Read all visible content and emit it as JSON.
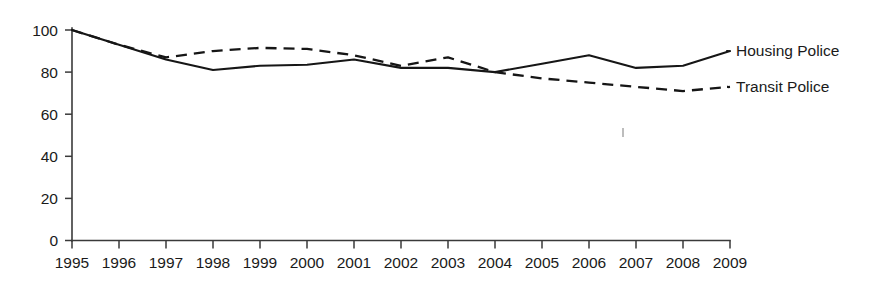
{
  "chart_data": {
    "type": "line",
    "title": "",
    "subtitle": "",
    "xlabel": "",
    "ylabel": "",
    "categories": [
      "1995",
      "1996",
      "1997",
      "1998",
      "1999",
      "2000",
      "2001",
      "2002",
      "2003",
      "2004",
      "2005",
      "2006",
      "2007",
      "2008",
      "2009"
    ],
    "x": [
      1995,
      1996,
      1997,
      1998,
      1999,
      2000,
      2001,
      2002,
      2003,
      2004,
      2005,
      2006,
      2007,
      2008,
      2009
    ],
    "xlim": [
      1995,
      2009
    ],
    "ylim": [
      0,
      100
    ],
    "yticks": [
      0,
      20,
      40,
      60,
      80,
      100
    ],
    "ytick_labels": [
      "0",
      "20",
      "40",
      "60",
      "80",
      "100"
    ],
    "grid": false,
    "legend_position": "right",
    "series": [
      {
        "name": "Housing Police",
        "style": "solid",
        "color": "#161616",
        "values": [
          100,
          93,
          86,
          81,
          83,
          83.5,
          86,
          82,
          82,
          80,
          84,
          88,
          82,
          83,
          90
        ]
      },
      {
        "name": "Transit Police",
        "style": "dashed",
        "color": "#161616",
        "values": [
          100,
          93,
          87,
          90,
          91.5,
          91,
          88,
          83,
          87,
          80,
          77,
          75,
          73,
          71,
          73
        ]
      }
    ]
  },
  "legend": {
    "items": [
      {
        "label": "Housing Police",
        "style": "solid"
      },
      {
        "label": "Transit Police",
        "style": "dashed"
      }
    ]
  },
  "axes": {
    "y_tick_labels": [
      "100",
      "80",
      "60",
      "40",
      "20",
      "0"
    ],
    "x_tick_labels": [
      "1995",
      "1996",
      "1997",
      "1998",
      "1999",
      "2000",
      "2001",
      "2002",
      "2003",
      "2004",
      "2005",
      "2006",
      "2007",
      "2008",
      "2009"
    ]
  }
}
